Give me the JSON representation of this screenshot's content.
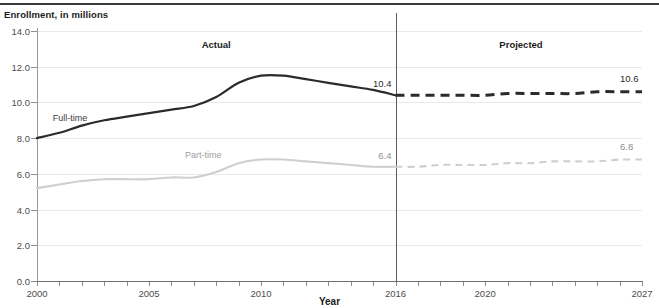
{
  "header": {
    "y_axis_caption": "Enrollment, in millions"
  },
  "axes": {
    "x_title": "Year",
    "y_ticks": [
      "0.0",
      "2.0",
      "4.0",
      "6.0",
      "8.0",
      "10.0",
      "12.0",
      "14.0"
    ],
    "x_ticks": [
      "2000",
      "2005",
      "2010",
      "2016",
      "2020",
      "2027"
    ]
  },
  "regions": {
    "actual": "Actual",
    "projected": "Projected",
    "divider_year": "2016"
  },
  "series_labels": {
    "full_time": "Full-time",
    "part_time": "Part-time"
  },
  "value_labels": {
    "full_time_2016": "10.4",
    "full_time_2027": "10.6",
    "part_time_2016": "6.4",
    "part_time_2027": "6.8"
  },
  "colors": {
    "full_time": "#2b2b2b",
    "part_time": "#cfcfcf",
    "grid": "#e9e9ed",
    "axis": "#6e6e6e",
    "divider": "#5c5c5c"
  },
  "chart_data": {
    "type": "line",
    "title": "",
    "subtitle": "",
    "xlabel": "Year",
    "ylabel": "Enrollment, in millions",
    "xlim": [
      2000,
      2027
    ],
    "ylim": [
      0.0,
      14.0
    ],
    "ytick_values": [
      0.0,
      2.0,
      4.0,
      6.0,
      8.0,
      10.0,
      12.0,
      14.0
    ],
    "xtick_values": [
      2000,
      2005,
      2010,
      2016,
      2020,
      2027
    ],
    "grid": "horizontal",
    "legend": "inline-labels",
    "annotations": [
      {
        "text": "Actual",
        "x": 2008
      },
      {
        "text": "Projected",
        "x": 2021.5
      },
      {
        "text": "10.4",
        "x": 2016,
        "y": 10.4
      },
      {
        "text": "6.4",
        "x": 2016,
        "y": 6.4
      },
      {
        "text": "10.6",
        "x": 2027,
        "y": 10.6
      },
      {
        "text": "6.8",
        "x": 2027,
        "y": 6.8
      }
    ],
    "x": [
      2000,
      2001,
      2002,
      2003,
      2004,
      2005,
      2006,
      2007,
      2008,
      2009,
      2010,
      2011,
      2012,
      2013,
      2014,
      2015,
      2016,
      2017,
      2018,
      2019,
      2020,
      2021,
      2022,
      2023,
      2024,
      2025,
      2026,
      2027
    ],
    "series": [
      {
        "name": "Full-time",
        "style": "solid-then-dashed",
        "actual_through": 2016,
        "color": "#2b2b2b",
        "values": [
          8.0,
          8.3,
          8.7,
          9.0,
          9.2,
          9.4,
          9.6,
          9.8,
          10.3,
          11.1,
          11.5,
          11.5,
          11.3,
          11.1,
          10.9,
          10.7,
          10.4,
          10.4,
          10.4,
          10.4,
          10.4,
          10.5,
          10.5,
          10.5,
          10.5,
          10.6,
          10.6,
          10.6
        ]
      },
      {
        "name": "Part-time",
        "style": "solid-then-dashed",
        "actual_through": 2016,
        "color": "#cfcfcf",
        "values": [
          5.2,
          5.4,
          5.6,
          5.7,
          5.7,
          5.7,
          5.8,
          5.8,
          6.1,
          6.6,
          6.8,
          6.8,
          6.7,
          6.6,
          6.5,
          6.4,
          6.4,
          6.4,
          6.5,
          6.5,
          6.5,
          6.6,
          6.6,
          6.7,
          6.7,
          6.7,
          6.8,
          6.8
        ]
      }
    ]
  }
}
